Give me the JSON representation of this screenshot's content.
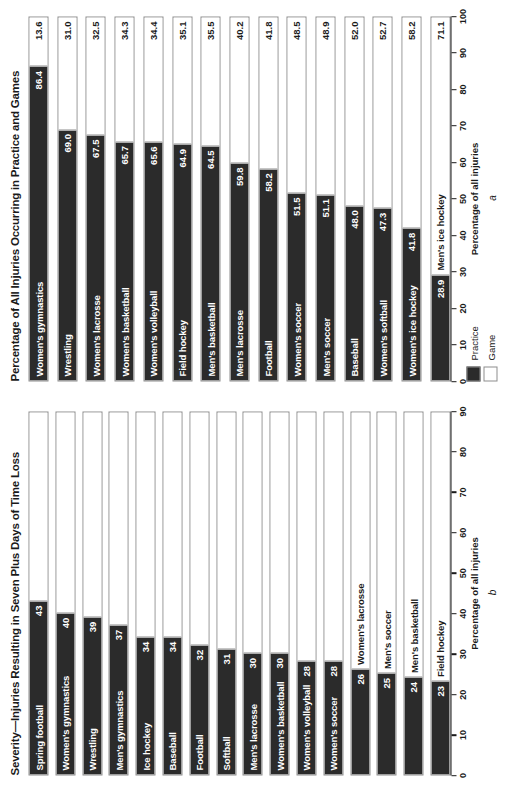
{
  "figure": {
    "legend": {
      "items": [
        {
          "label": "Practice",
          "swatch": "practice",
          "color": "#2b2b2b"
        },
        {
          "label": "Game",
          "swatch": "game",
          "color": "#ffffff"
        }
      ]
    }
  },
  "chart_data": [
    {
      "id": "a",
      "type": "bar",
      "orientation": "horizontal",
      "stacked": true,
      "panel_letter": "a",
      "title": "Percentage of All Injuries Occurring in Practice and Games",
      "xlabel": "Percentage of all injuries",
      "ylabel": "",
      "xlim": [
        0,
        100
      ],
      "xticks": [
        0,
        10,
        20,
        30,
        40,
        50,
        60,
        70,
        80,
        90,
        100
      ],
      "grid": false,
      "legend_position": "below-left",
      "categories": [
        "Women's gymnastics",
        "Wrestling",
        "Women's lacrosse",
        "Women's basketball",
        "Women's volleyball",
        "Field hockey",
        "Men's basketball",
        "Men's lacrosse",
        "Football",
        "Women's soccer",
        "Men's soccer",
        "Baseball",
        "Women's softball",
        "Women's ice hockey",
        "Men's ice hockey"
      ],
      "series": [
        {
          "name": "Practice",
          "values": [
            86.4,
            69.0,
            67.5,
            65.7,
            65.6,
            64.9,
            64.5,
            59.8,
            58.2,
            51.5,
            51.1,
            48.0,
            47.3,
            41.8,
            28.9
          ]
        },
        {
          "name": "Game",
          "values": [
            13.6,
            31.0,
            32.5,
            34.3,
            34.4,
            35.1,
            35.5,
            40.2,
            41.8,
            48.5,
            48.9,
            52.0,
            52.7,
            58.2,
            71.1
          ]
        }
      ]
    },
    {
      "id": "b",
      "type": "bar",
      "orientation": "horizontal",
      "stacked": true,
      "panel_letter": "b",
      "title": "Severity—Injuries Resulting in Seven Plus Days of Time Loss",
      "xlabel": "Percentage of all injuries",
      "ylabel": "",
      "xlim": [
        0,
        90
      ],
      "xticks": [
        0,
        10,
        20,
        30,
        40,
        50,
        60,
        70,
        80,
        90
      ],
      "grid": false,
      "legend_position": "none",
      "categories": [
        "Spring football",
        "Women's gymnastics",
        "Wrestling",
        "Men's gymnastics",
        "Ice hockey",
        "Baseball",
        "Football",
        "Softball",
        "Men's lacrosse",
        "Women's basketball",
        "Women's volleyball",
        "Women's soccer",
        "Women's lacrosse",
        "Men's soccer",
        "Men's basketball",
        "Field hockey"
      ],
      "series": [
        {
          "name": "Seven plus days of time loss",
          "values": [
            43,
            40,
            39,
            37,
            34,
            34,
            32,
            31,
            30,
            30,
            28,
            28,
            26,
            25,
            24,
            23
          ]
        }
      ]
    }
  ]
}
